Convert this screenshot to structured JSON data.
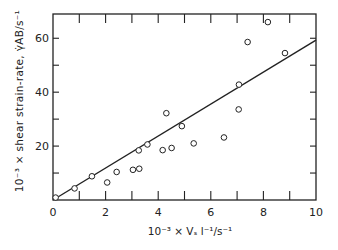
{
  "chart_data": {
    "type": "scatter",
    "title": "",
    "xlabel": "10⁻³ × Vₛ l⁻¹/s⁻¹",
    "ylabel": "10⁻³ × shear strain-rate, γ̇ₐᵦ/s⁻¹",
    "xlim": [
      0,
      10
    ],
    "ylim": [
      0,
      69
    ],
    "xticks": [
      0,
      2,
      4,
      6,
      8,
      10
    ],
    "xminor": [
      1,
      3,
      5,
      7,
      9
    ],
    "yticks": [
      20,
      40,
      60
    ],
    "yminor": [
      10,
      30,
      50
    ],
    "grid": false,
    "legend": null,
    "series": [
      {
        "name": "measurements",
        "marker": "open-circle",
        "points": [
          [
            0.1,
            0.9
          ],
          [
            0.82,
            4.3
          ],
          [
            1.48,
            8.8
          ],
          [
            2.06,
            6.5
          ],
          [
            2.42,
            10.4
          ],
          [
            3.04,
            11.2
          ],
          [
            3.28,
            11.6
          ],
          [
            3.26,
            18.4
          ],
          [
            3.59,
            20.6
          ],
          [
            4.17,
            18.5
          ],
          [
            4.31,
            32.2
          ],
          [
            4.51,
            19.3
          ],
          [
            4.9,
            27.4
          ],
          [
            5.35,
            21.0
          ],
          [
            6.5,
            23.2
          ],
          [
            7.06,
            33.6
          ],
          [
            7.07,
            42.8
          ],
          [
            7.4,
            58.6
          ],
          [
            8.17,
            66.0
          ],
          [
            8.82,
            54.5
          ]
        ]
      },
      {
        "name": "linear fit",
        "type": "line",
        "points": [
          [
            0,
            0
          ],
          [
            10,
            59.3
          ]
        ]
      }
    ]
  },
  "labels": {
    "x_axis": "10⁻³ × Vₛ l⁻¹/s⁻¹",
    "y_axis": "10⁻³ × shear  strain-rate, γ̇AB/s⁻¹"
  }
}
